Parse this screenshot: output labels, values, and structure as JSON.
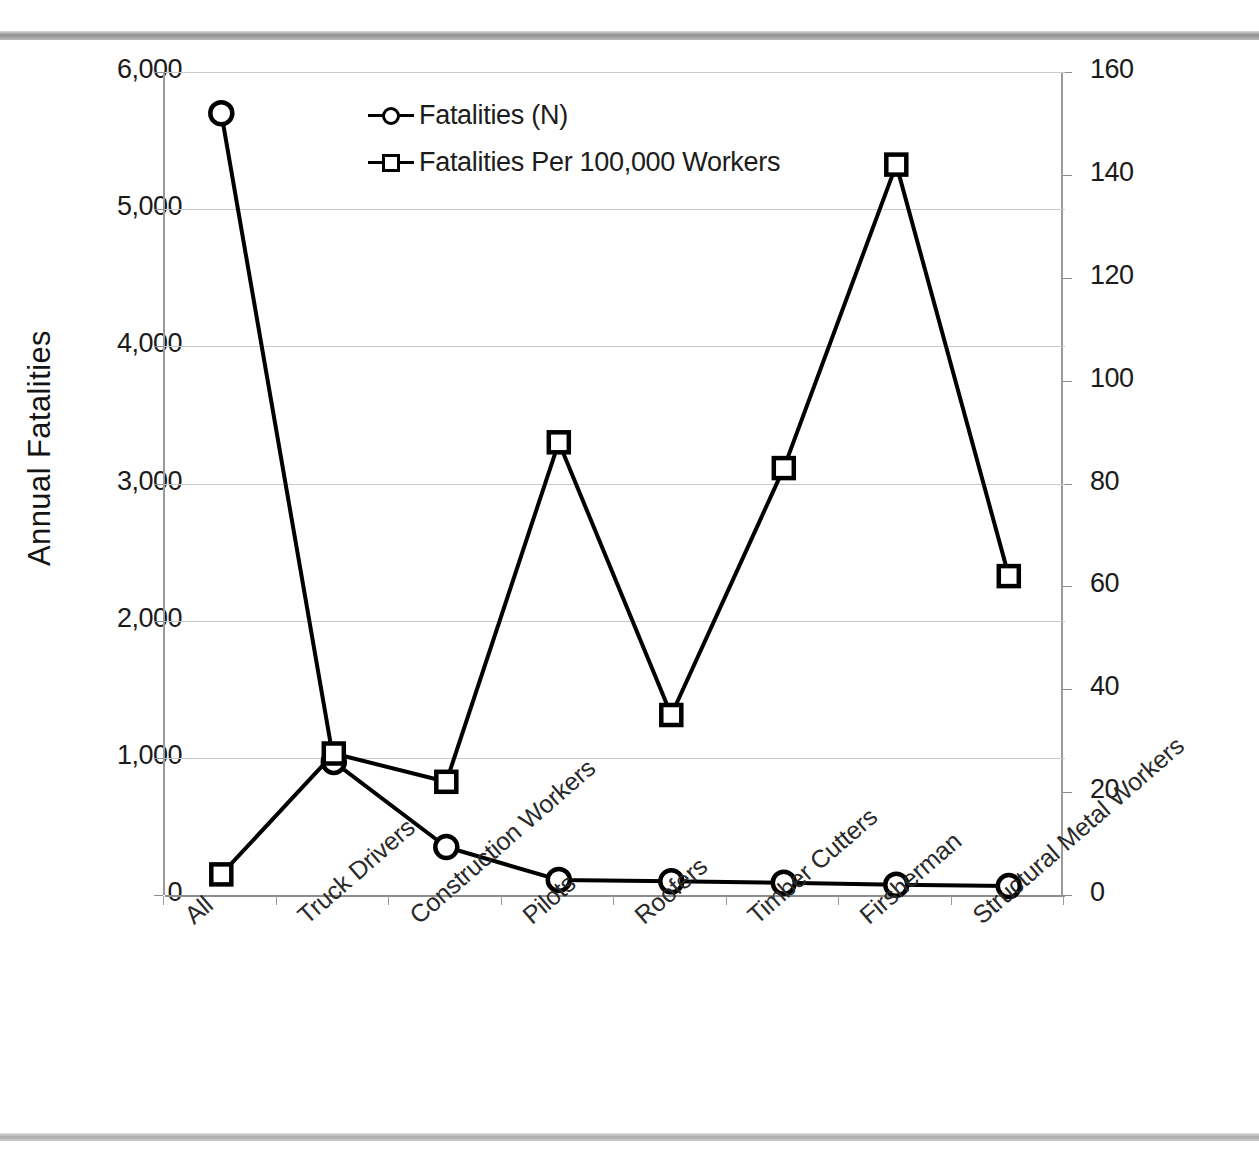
{
  "chart_data": {
    "type": "line",
    "title": "",
    "categories": [
      "All",
      "Truck Drivers",
      "Construction Workers",
      "Pilots",
      "Roofers",
      "Timber Cutters",
      "Firsherman",
      "Structural Metal Workers"
    ],
    "series": [
      {
        "name": "Fatalities (N)",
        "marker": "circle",
        "axis": "left",
        "values": [
          5700,
          970,
          350,
          110,
          100,
          90,
          75,
          65
        ]
      },
      {
        "name": "Fatalities Per 100,000 Workers",
        "marker": "square",
        "axis": "right",
        "values": [
          4,
          27.5,
          22,
          88,
          35,
          83,
          142,
          62
        ]
      }
    ],
    "xlabel": "",
    "ylabel": "Annual Fatalities",
    "y2label": "Fatality Incidence (Fatalities Per 100,000 Workers)",
    "ylim": [
      0,
      6000
    ],
    "y2lim": [
      0,
      160
    ],
    "yticks": [
      "0",
      "1,000",
      "2,000",
      "3,000",
      "4,000",
      "5,000",
      "6,000"
    ],
    "ytick_values": [
      0,
      1000,
      2000,
      3000,
      4000,
      5000,
      6000
    ],
    "y2ticks": [
      "0",
      "20",
      "40",
      "60",
      "80",
      "100",
      "120",
      "140",
      "160"
    ],
    "y2tick_values": [
      0,
      20,
      40,
      60,
      80,
      100,
      120,
      140,
      160
    ],
    "grid": true,
    "legend_position": "top-center",
    "line_color": "#000000",
    "grid_color": "#c9c9c9",
    "axis_color": "#8d8d8d"
  },
  "legend": {
    "items": [
      {
        "label": "Fatalities (N)",
        "marker": "circle"
      },
      {
        "label": "Fatalities Per 100,000 Workers",
        "marker": "square"
      }
    ]
  },
  "axes": {
    "left_title": "Annual Fatalities",
    "right_title": "Fatality Incidence (Fatalities Per 100,000 Workers)"
  }
}
